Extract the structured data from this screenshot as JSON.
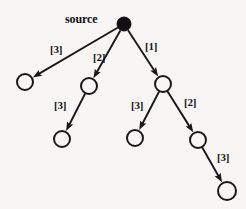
{
  "diagram": {
    "title_label": "source",
    "node_radius": 8,
    "source_radius": 7,
    "colors": {
      "background": "#f7f6f4",
      "edge": "#1a181c",
      "node_stroke": "#1a181c",
      "node_fill": "#f7f6f4",
      "source_fill": "#120f14",
      "text": "#17161a"
    },
    "nodes": [
      {
        "id": "source",
        "name": "source-node",
        "x": 124,
        "y": 24,
        "filled": true,
        "r": 7
      },
      {
        "id": "n1",
        "name": "node-left",
        "x": 25,
        "y": 82,
        "filled": false,
        "r": 8
      },
      {
        "id": "n2",
        "name": "node-middle",
        "x": 89,
        "y": 86,
        "filled": false,
        "r": 8
      },
      {
        "id": "n3",
        "name": "node-right",
        "x": 163,
        "y": 84,
        "filled": false,
        "r": 8
      },
      {
        "id": "n4",
        "name": "node-lower-left",
        "x": 62,
        "y": 139,
        "filled": false,
        "r": 8
      },
      {
        "id": "n5",
        "name": "node-lower-mid",
        "x": 135,
        "y": 138,
        "filled": false,
        "r": 8
      },
      {
        "id": "n6",
        "name": "node-lower-right",
        "x": 198,
        "y": 140,
        "filled": false,
        "r": 8
      },
      {
        "id": "n7",
        "name": "node-bottom-right",
        "x": 227,
        "y": 191,
        "filled": false,
        "r": 9
      }
    ],
    "edges": [
      {
        "id": "e1",
        "name": "edge-source-to-left",
        "from": "source",
        "to": "n1",
        "weight": "[3]",
        "label_x": 50,
        "label_y": 44
      },
      {
        "id": "e2",
        "name": "edge-source-to-middle",
        "from": "source",
        "to": "n2",
        "weight": "[2]",
        "label_x": 93,
        "label_y": 52
      },
      {
        "id": "e3",
        "name": "edge-source-to-right",
        "from": "source",
        "to": "n3",
        "weight": "[1]",
        "label_x": 145,
        "label_y": 41
      },
      {
        "id": "e4",
        "name": "edge-middle-to-lower-left",
        "from": "n2",
        "to": "n4",
        "weight": "[3]",
        "label_x": 54,
        "label_y": 100
      },
      {
        "id": "e5",
        "name": "edge-right-to-lower-mid",
        "from": "n3",
        "to": "n5",
        "weight": "[3]",
        "label_x": 131,
        "label_y": 100
      },
      {
        "id": "e6",
        "name": "edge-right-to-lower-right",
        "from": "n3",
        "to": "n6",
        "weight": "[2]",
        "label_x": 184,
        "label_y": 97
      },
      {
        "id": "e7",
        "name": "edge-lower-right-to-bottom",
        "from": "n6",
        "to": "n7",
        "weight": "[3]",
        "label_x": 217,
        "label_y": 152
      }
    ],
    "source_label": {
      "x": 65,
      "y": 13
    }
  }
}
